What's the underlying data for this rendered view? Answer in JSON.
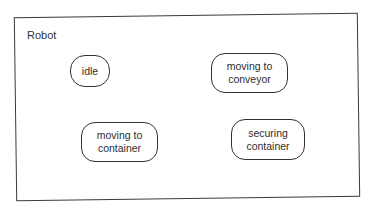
{
  "diagram": {
    "type": "state-machine",
    "container": {
      "title": "Robot"
    },
    "states": [
      {
        "id": "idle",
        "lines": [
          "idle"
        ]
      },
      {
        "id": "moving-to-conveyor",
        "lines": [
          "moving to",
          "conveyor"
        ]
      },
      {
        "id": "moving-to-container",
        "lines": [
          "moving to",
          "container"
        ]
      },
      {
        "id": "securing-container",
        "lines": [
          "securing",
          "container"
        ]
      }
    ],
    "transitions": []
  },
  "colors": {
    "stroke": "#333333",
    "background": "#ffffff",
    "text": "#2e2e2e"
  }
}
